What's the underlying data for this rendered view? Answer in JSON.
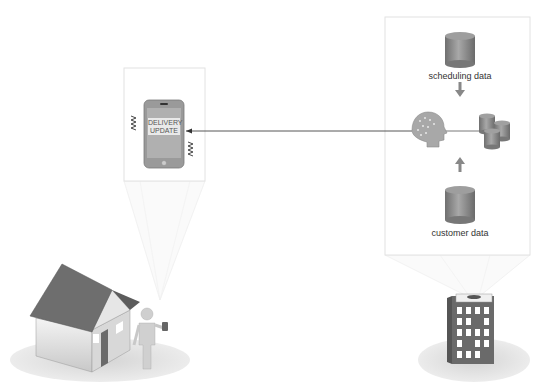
{
  "diagram": {
    "phone_panel": {
      "screen_text_line1": "DELIVERY",
      "screen_text_line2": "UPDATE",
      "icon": "smartphone-vibrating-icon"
    },
    "server_panel": {
      "sources": [
        {
          "label": "scheduling data",
          "icon": "database-cylinder-icon"
        },
        {
          "label": "customer data",
          "icon": "database-cylinder-icon"
        }
      ],
      "processor_icon": "ai-brain-head-icon",
      "storage_icon": "database-cluster-icon"
    },
    "scene": {
      "left": [
        "house-icon",
        "person-with-phone-icon"
      ],
      "right": [
        "office-building-icon"
      ]
    },
    "colors": {
      "frame_border": "#e4e4e4",
      "cylinder": "#8a8a8a",
      "arrow": "#888888",
      "connector": "#444444",
      "roof": "#6e6e6e",
      "phone": "#999999"
    }
  }
}
